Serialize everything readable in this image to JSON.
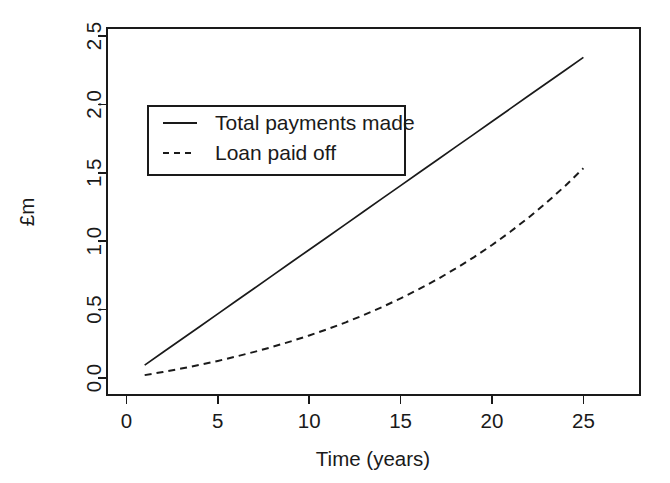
{
  "chart_data": {
    "type": "line",
    "title": "",
    "subtitle": "",
    "xlabel": "Time (years)",
    "ylabel": "£m",
    "xlim": [
      0,
      26
    ],
    "ylim": [
      0.0,
      2.5
    ],
    "xticks": [
      0,
      5,
      10,
      15,
      20,
      25
    ],
    "xtick_labels": [
      "0",
      "5",
      "10",
      "15",
      "20",
      "25"
    ],
    "yticks": [
      0.0,
      0.5,
      1.0,
      1.5,
      2.0,
      2.5
    ],
    "ytick_labels": [
      "0.0",
      "0.5",
      "1.0",
      "1.5",
      "2.0",
      "2.5"
    ],
    "grid": false,
    "legend_position": "upper left (inside plot area)",
    "frame": "box",
    "x": [
      1,
      2,
      3,
      4,
      5,
      6,
      7,
      8,
      9,
      10,
      11,
      12,
      13,
      14,
      15,
      16,
      17,
      18,
      19,
      20,
      21,
      22,
      23,
      24,
      25
    ],
    "series": [
      {
        "name": "Total payments made",
        "style": "solid",
        "color": "#1a1a1a",
        "values": [
          0.094,
          0.188,
          0.281,
          0.375,
          0.469,
          0.563,
          0.656,
          0.75,
          0.844,
          0.938,
          1.031,
          1.125,
          1.219,
          1.313,
          1.406,
          1.5,
          1.594,
          1.688,
          1.781,
          1.875,
          1.969,
          2.063,
          2.156,
          2.25,
          2.344
        ]
      },
      {
        "name": "Loan paid off",
        "style": "dashed",
        "color": "#1a1a1a",
        "values": [
          0.021,
          0.044,
          0.069,
          0.096,
          0.125,
          0.157,
          0.191,
          0.228,
          0.268,
          0.311,
          0.357,
          0.407,
          0.461,
          0.519,
          0.582,
          0.649,
          0.721,
          0.799,
          0.882,
          0.972,
          1.069,
          1.172,
          1.284,
          1.404,
          1.533
        ]
      }
    ]
  },
  "axes": {
    "y_axis_title": "£m",
    "x_axis_title": "Time (years)"
  },
  "legend": {
    "entries": [
      {
        "label": "Total payments made",
        "style": "solid"
      },
      {
        "label": "Loan paid off",
        "style": "dashed"
      }
    ]
  },
  "colors": {
    "ink": "#1a1a1a",
    "background": "#ffffff"
  }
}
